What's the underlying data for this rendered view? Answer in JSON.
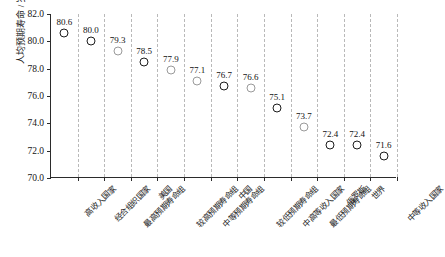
{
  "chart_data": {
    "type": "scatter",
    "title": "",
    "xlabel": "",
    "ylabel": "人均预期寿命 / 岁",
    "ylim": [
      70.0,
      82.0
    ],
    "yticks": [
      "70.0",
      "72.0",
      "74.0",
      "76.0",
      "78.0",
      "80.0",
      "82.0"
    ],
    "grid": "vertical-dashed",
    "legend": "none",
    "categories": [
      "高收入国家",
      "经合组织国家",
      "最高预期寿命组",
      "美国",
      "较高预期寿命组",
      "中等预期寿命组",
      "中国",
      "较低预期寿命组",
      "中高等收入国家",
      "最低预期寿命组",
      "俄罗斯",
      "世界",
      "中等收入国家"
    ],
    "values": [
      80.6,
      80.0,
      79.3,
      78.5,
      77.9,
      77.1,
      76.7,
      76.6,
      75.1,
      73.7,
      72.4,
      72.4,
      71.6
    ],
    "point_labels": [
      "80.6",
      "80.0",
      "79.3",
      "78.5",
      "77.9",
      "77.1",
      "76.7",
      "76.6",
      "75.1",
      "73.7",
      "72.4",
      "72.4",
      "71.6"
    ],
    "marker_styles": [
      "dark",
      "dark",
      "light",
      "dark",
      "light",
      "light",
      "dark",
      "light",
      "dark",
      "light",
      "dark",
      "dark",
      "dark"
    ],
    "colors": {
      "marker_dark": "#1c1c1c",
      "marker_light": "#9a9a9a",
      "gridline": "#b9b9b9",
      "axis": "#2b2b2b",
      "text": "#111111",
      "background": "#ffffff"
    }
  }
}
